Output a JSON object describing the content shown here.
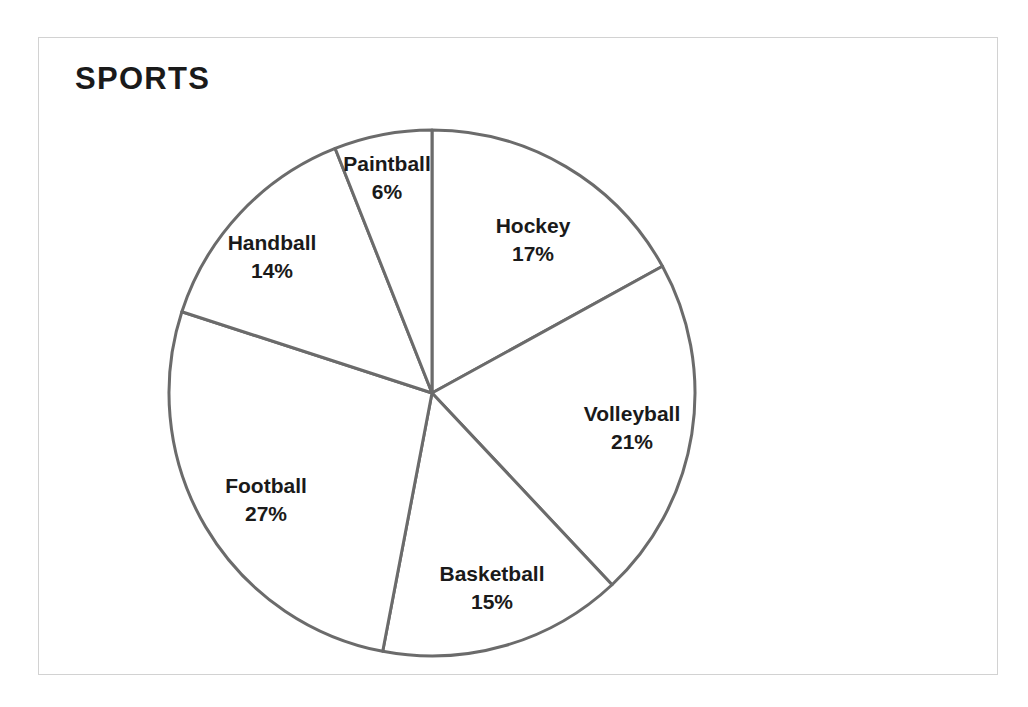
{
  "chart_data": {
    "type": "pie",
    "title": "SPORTS",
    "xlabel": "",
    "ylabel": "",
    "unit": "%",
    "start_angle_deg": 0,
    "direction": "clockwise",
    "legend": "none",
    "grid": false,
    "categories": [
      "Hockey",
      "Volleyball",
      "Basketball",
      "Football",
      "Handball",
      "Paintball"
    ],
    "values": [
      17,
      21,
      15,
      27,
      14,
      6
    ],
    "total": 100,
    "slices": [
      {
        "label": "Hockey",
        "value": 17,
        "value_text": "17%",
        "start_deg": 0,
        "end_deg": 61.2,
        "label_x": 533,
        "label_y": 240
      },
      {
        "label": "Volleyball",
        "value": 21,
        "value_text": "21%",
        "start_deg": 61.2,
        "end_deg": 136.8,
        "label_x": 632,
        "label_y": 428
      },
      {
        "label": "Basketball",
        "value": 15,
        "value_text": "15%",
        "start_deg": 136.8,
        "end_deg": 190.8,
        "label_x": 492,
        "label_y": 588
      },
      {
        "label": "Football",
        "value": 27,
        "value_text": "27%",
        "start_deg": 190.8,
        "end_deg": 288.0,
        "label_x": 266,
        "label_y": 500
      },
      {
        "label": "Handball",
        "value": 14,
        "value_text": "14%",
        "start_deg": 288.0,
        "end_deg": 338.4,
        "label_x": 272,
        "label_y": 257
      },
      {
        "label": "Paintball",
        "value": 6,
        "value_text": "6%",
        "start_deg": 338.4,
        "end_deg": 360.0,
        "label_x": 387,
        "label_y": 178
      }
    ],
    "geometry": {
      "center_x": 432,
      "center_y": 393,
      "radius": 263
    },
    "colors": {
      "slice_fill": "#ffffff",
      "slice_stroke": "#6b6b6b",
      "text": "#1a1a1a",
      "frame_border": "#d2d2d2",
      "background": "#ffffff"
    }
  }
}
